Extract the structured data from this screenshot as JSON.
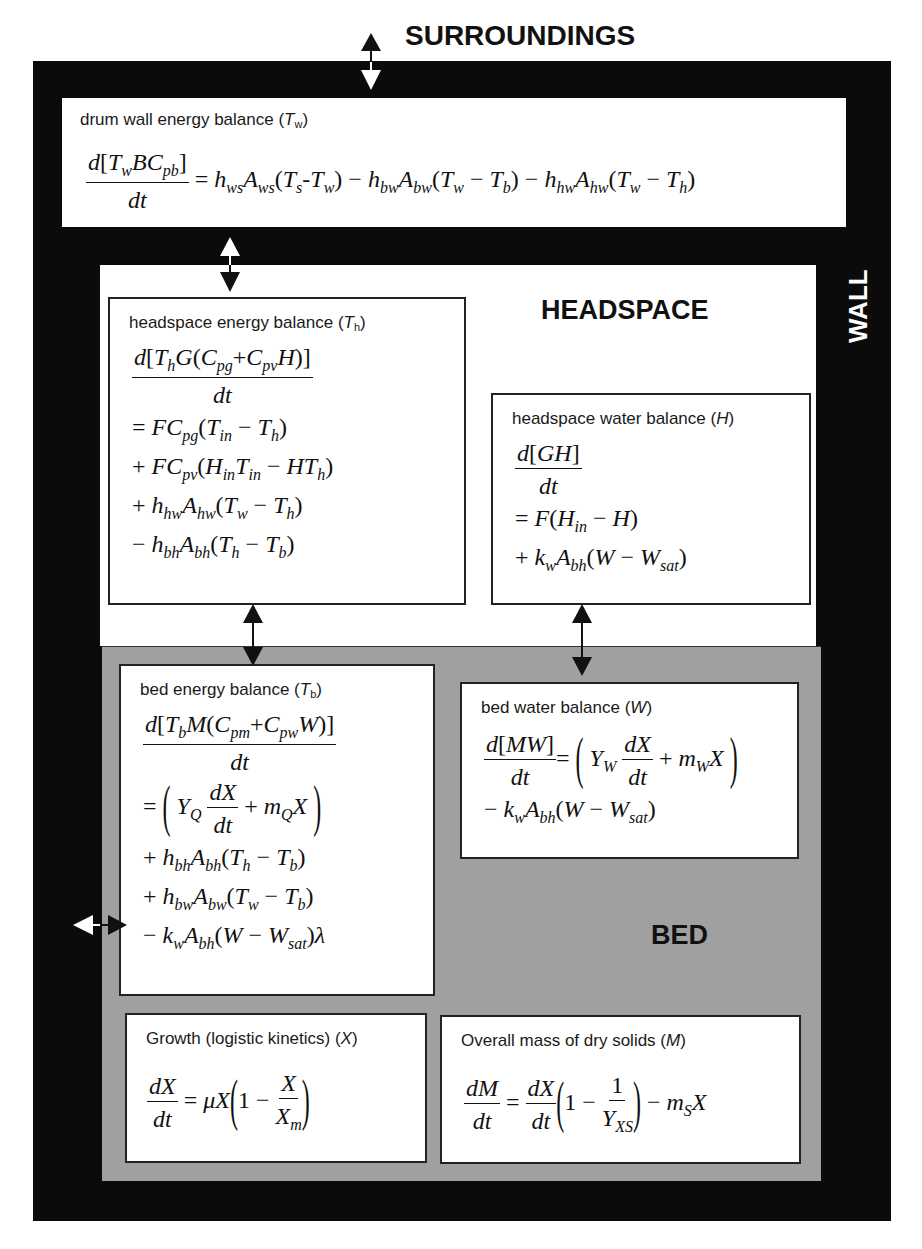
{
  "labels": {
    "surroundings": "SURROUNDINGS",
    "wall": "WALL",
    "headspace": "HEADSPACE",
    "bed": "BED"
  },
  "boxes": {
    "drum_wall": {
      "title": "drum wall energy balance (",
      "var": "T",
      "var_sub": "w",
      "close": ")",
      "equation": "d[T_w B C_pb]/dt = h_ws A_ws (T_s - T_w) - h_bw A_bw (T_w - T_b) - h_hw A_hw (T_w - T_h)"
    },
    "headspace_energy": {
      "title": "headspace energy balance (",
      "var": "T",
      "var_sub": "h",
      "close": ")",
      "equation_lines": [
        "d[T_h G(C_pg + C_pv H)]/dt",
        "= F C_pg (T_in - T_h)",
        "+ F C_pv (H_in T_in - H T_h)",
        "+ h_hw A_hw (T_w - T_h)",
        "- h_bh A_bh (T_h - T_b)"
      ]
    },
    "headspace_water": {
      "title": "headspace water balance (",
      "var": "H",
      "var_sub": "",
      "close": ")",
      "equation_lines": [
        "d[GH]/dt",
        "= F(H_in - H)",
        "+ k_w A_bh (W - W_sat)"
      ]
    },
    "bed_energy": {
      "title": "bed energy balance (",
      "var": "T",
      "var_sub": "b",
      "close": ")",
      "equation_lines": [
        "d[T_b M(C_pm + C_pw W)]/dt",
        "= (Y_Q dX/dt + m_Q X)",
        "+ h_bh A_bh (T_h - T_b)",
        "+ h_bw A_bw (T_w - T_b)",
        "- k_w A_bh (W - W_sat) λ"
      ]
    },
    "bed_water": {
      "title": "bed water balance (",
      "var": "W",
      "var_sub": "",
      "close": ")",
      "equation_lines": [
        "d[MW]/dt = (Y_W dX/dt + m_W X)",
        "- k_w A_bh (W - W_sat)"
      ]
    },
    "growth": {
      "title": "Growth (logistic kinetics) (",
      "var": "X",
      "var_sub": "",
      "close": ")",
      "equation": "dX/dt = μX(1 - X/X_m)"
    },
    "dry_solids": {
      "title": "Overall mass of dry solids (",
      "var": "M",
      "var_sub": "",
      "close": ")",
      "equation": "dM/dt = dX/dt (1 - 1/Y_XS) - m_S X"
    }
  },
  "colors": {
    "wall": "#0b0b0b",
    "headspace": "#ffffff",
    "bed": "#a0a0a0",
    "box": "#ffffff"
  }
}
